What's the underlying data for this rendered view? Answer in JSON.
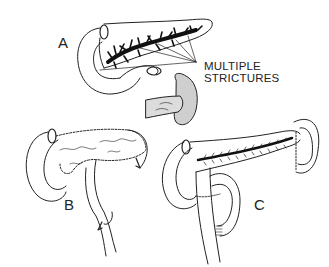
{
  "figure": {
    "panels": [
      {
        "id": "A",
        "label": "A",
        "description": "Pancreas with dilated main duct showing multiple strictures"
      },
      {
        "id": "B",
        "label": "B",
        "description": "Partial pancreaticojejunostomy with Roux-en-Y limb"
      },
      {
        "id": "C",
        "label": "C",
        "description": "Longitudinal pancreaticojejunostomy with Roux-en-Y limb"
      }
    ],
    "annotation": {
      "line1": "MULTIPLE",
      "line2": "STRICTURES"
    },
    "colors": {
      "ink": "#222222",
      "shade": "#cfcfcf",
      "background": "#ffffff"
    }
  }
}
